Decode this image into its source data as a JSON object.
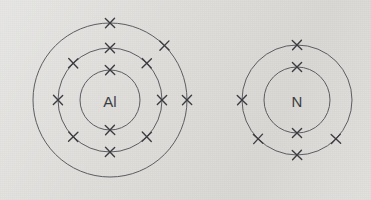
{
  "figure": {
    "background_color": "#dddcd9",
    "ring_color": "#5c5c62",
    "electron_color": "#3a3a40",
    "label_color": "#3c3c42",
    "electron_marker": "cross"
  },
  "atoms": [
    {
      "symbol": "Al",
      "name": "aluminium-atom",
      "center": {
        "x": 110,
        "y": 100
      },
      "label_offset_y": 1,
      "shells": [
        {
          "name": "inner-shell",
          "radius": 30,
          "electron_count": 2,
          "electron_angles": [
            270,
            90
          ]
        },
        {
          "name": "middle-shell",
          "radius": 52,
          "electron_count": 8,
          "electron_angles": [
            270,
            315,
            0,
            45,
            90,
            135,
            180,
            225
          ]
        },
        {
          "name": "outer-shell",
          "radius": 77,
          "electron_count": 3,
          "electron_angles": [
            270,
            315,
            0
          ]
        }
      ]
    },
    {
      "symbol": "N",
      "name": "nitrogen-atom",
      "center": {
        "x": 297,
        "y": 100
      },
      "label_offset_y": 1,
      "shells": [
        {
          "name": "inner-shell",
          "radius": 33,
          "electron_count": 2,
          "electron_angles": [
            270,
            90
          ]
        },
        {
          "name": "outer-shell",
          "radius": 55,
          "electron_count": 5,
          "electron_angles": [
            270,
            90,
            135,
            180,
            45
          ]
        }
      ]
    }
  ],
  "electron_cross": {
    "arm_length": 4.6
  }
}
